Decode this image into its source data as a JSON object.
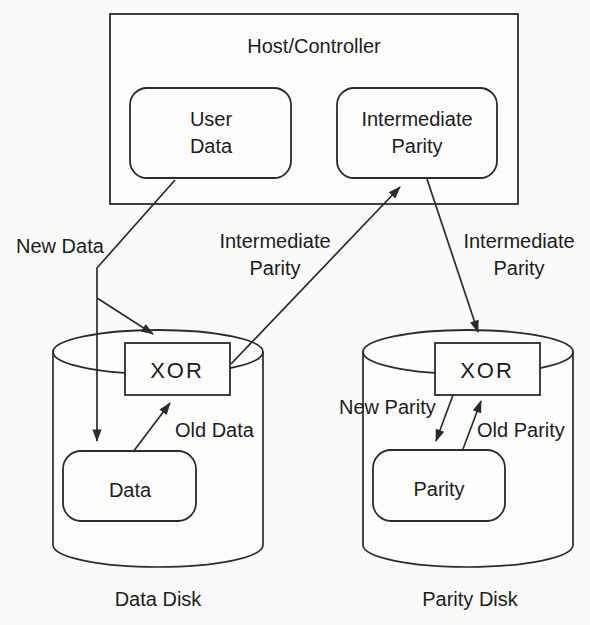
{
  "diagram": {
    "host": {
      "title": "Host/Controller",
      "user_data": {
        "line1": "User",
        "line2": "Data"
      },
      "intermediate_parity": {
        "line1": "Intermediate",
        "line2": "Parity"
      }
    },
    "flow_labels": {
      "new_data": "New Data",
      "intermediate_parity_left": {
        "line1": "Intermediate",
        "line2": "Parity"
      },
      "intermediate_parity_right": {
        "line1": "Intermediate",
        "line2": "Parity"
      },
      "old_data": "Old Data",
      "new_parity": "New Parity",
      "old_parity": "Old Parity"
    },
    "data_disk": {
      "xor": "XOR",
      "block": "Data",
      "caption": "Data Disk"
    },
    "parity_disk": {
      "xor": "XOR",
      "block": "Parity",
      "caption": "Parity Disk"
    },
    "colors": {
      "line": "#2b2b2b",
      "text": "#1c1c1c",
      "background": "#fafaf8",
      "box_fill": "#fdfdfc"
    }
  }
}
